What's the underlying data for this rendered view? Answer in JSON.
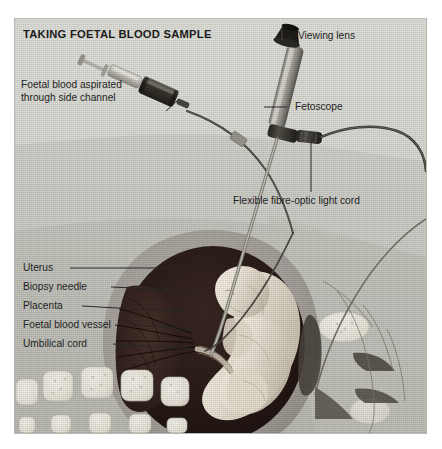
{
  "illustration": {
    "title": "TAKING FOETAL BLOOD SAMPLE",
    "subject": "fetoscopy-foetal-blood-sampling-cross-section",
    "palette": {
      "plate_background": "#dcdcd6",
      "plate_border": "#b9b9b4",
      "page_background": "#ffffff",
      "abdominal_tissue_upper": "#cfcfc9",
      "abdominal_tissue_lower": "#c4c4bd",
      "uterus_wall": "#a9a49f",
      "uterine_cavity": "#2b1d1a",
      "placenta": "#3a2722",
      "foetus_skin": "#efe9de",
      "vertebra": "#f2efe6",
      "instrument_metal": "#b4b2ab",
      "instrument_dark": "#3c3935",
      "leader_line": "#2a2a2a",
      "text": "#1f1f1f"
    }
  },
  "labels": {
    "top_left": {
      "id": "foetal-blood-aspirated",
      "line1": "Foetal blood aspirated",
      "line2": "through side channel"
    },
    "viewing_lens": "Viewing lens",
    "fetoscope": "Fetoscope",
    "light_cord": "Flexible fibre-optic light cord",
    "anatomy": [
      {
        "id": "uterus",
        "text": "Uterus"
      },
      {
        "id": "biopsy-needle",
        "text": "Biopsy needle"
      },
      {
        "id": "placenta",
        "text": "Placenta"
      },
      {
        "id": "foetal-blood-vessel",
        "text": "Foetal blood vessel"
      },
      {
        "id": "umbilical-cord",
        "text": "Umbilical cord"
      }
    ]
  },
  "instruments": [
    {
      "id": "syringe",
      "name": "syringe-with-side-channel"
    },
    {
      "id": "fetoscope",
      "name": "fetoscope-endoscope"
    },
    {
      "id": "viewing-lens",
      "name": "eyepiece-viewing-lens"
    },
    {
      "id": "light-cord",
      "name": "fibre-optic-light-cord"
    },
    {
      "id": "biopsy-needle",
      "name": "biopsy-needle"
    }
  ],
  "anatomy_parts": [
    {
      "id": "abdominal-wall",
      "name": "maternal-abdominal-wall"
    },
    {
      "id": "uterus-wall",
      "name": "uterus-wall"
    },
    {
      "id": "uterine-cavity",
      "name": "uterine-cavity"
    },
    {
      "id": "placenta-mass",
      "name": "placenta"
    },
    {
      "id": "foetus",
      "name": "foetus"
    },
    {
      "id": "umbilical-cord",
      "name": "umbilical-cord"
    },
    {
      "id": "spine",
      "name": "maternal-spine-vertebrae"
    }
  ]
}
